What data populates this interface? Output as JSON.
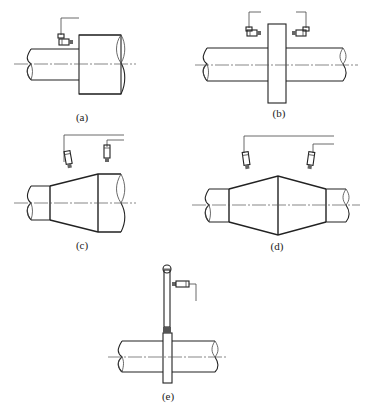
{
  "figure": {
    "panels": [
      {
        "id": "a",
        "label": "(a)",
        "description": "Shaft step with one radial proximity probe facing the shoulder face"
      },
      {
        "id": "b",
        "label": "(b)",
        "description": "Shaft collar with two opposing probes facing both collar faces"
      },
      {
        "id": "c",
        "label": "(c)",
        "description": "Conical shaft section with two probes above the taper"
      },
      {
        "id": "d",
        "label": "(d)",
        "description": "Double-cone shaft section with two probes above both tapers"
      },
      {
        "id": "e",
        "label": "(e)",
        "description": "Shaft collar with lever arm and ball tip, probe facing lever"
      }
    ]
  }
}
